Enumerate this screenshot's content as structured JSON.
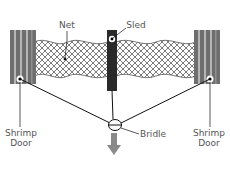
{
  "diagram": {
    "title": "",
    "labels": {
      "net": "Net",
      "sled": "Sled",
      "left_door_line1": "Shrimp",
      "left_door_line2": "Door",
      "right_door_line1": "Shrimp",
      "right_door_line2": "Door",
      "bridle": "Bridle"
    },
    "colors": {
      "door_fill": "#6e6e6e",
      "door_stripe": "#b5b5b5",
      "sled_fill": "#2a2a2a",
      "net_stroke": "#444444",
      "line": "#111111",
      "arrow": "#8a8a8a",
      "label_text": "#555555"
    },
    "components": [
      "Shrimp Door (left)",
      "Net",
      "Sled",
      "Shrimp Door (right)",
      "Bridle",
      "Tow direction arrow"
    ]
  }
}
